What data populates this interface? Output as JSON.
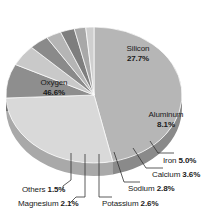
{
  "chart_data": {
    "type": "pie",
    "title": "",
    "subtitle": "",
    "xlabel": "",
    "ylabel": "",
    "legend_position": "none",
    "grid": false,
    "unit": "%",
    "categories": [
      "Oxygen",
      "Silicon",
      "Aluminum",
      "Iron",
      "Calcium",
      "Sodium",
      "Potassium",
      "Magnesium",
      "Others"
    ],
    "values": [
      46.6,
      27.7,
      8.1,
      5.0,
      3.6,
      2.8,
      2.6,
      2.1,
      1.5
    ],
    "slices": [
      {
        "name": "Oxygen",
        "value": 46.6,
        "label": "Oxygen",
        "value_label": "46.6%",
        "color": "#b6b6b6",
        "side_color": "#8a8a8a",
        "label_placement": "inside"
      },
      {
        "name": "Silicon",
        "value": 27.7,
        "label": "Silicon",
        "value_label": "27.7%",
        "color": "#d9d9d9",
        "side_color": "#a9a9a9",
        "label_placement": "inside"
      },
      {
        "name": "Aluminum",
        "value": 8.1,
        "label": "Aluminum",
        "value_label": "8.1%",
        "color": "#8e8e8e",
        "side_color": "#6d6d6d",
        "label_placement": "inside"
      },
      {
        "name": "Iron",
        "value": 5.0,
        "label": "Iron",
        "value_label": "5.0%",
        "color": "#c9c9c9",
        "side_color": "#9a9a9a",
        "label_placement": "callout"
      },
      {
        "name": "Calcium",
        "value": 3.6,
        "label": "Calcium",
        "value_label": "3.6%",
        "color": "#8a8a8a",
        "side_color": "#6a6a6a",
        "label_placement": "callout"
      },
      {
        "name": "Sodium",
        "value": 2.8,
        "label": "Sodium",
        "value_label": "2.8%",
        "color": "#b5b5b5",
        "side_color": "#8b8b8b",
        "label_placement": "callout"
      },
      {
        "name": "Potassium",
        "value": 2.6,
        "label": "Potassium",
        "value_label": "2.6%",
        "color": "#7e7e7e",
        "side_color": "#5f5f5f",
        "label_placement": "callout"
      },
      {
        "name": "Magnesium",
        "value": 2.1,
        "label": "Magnesium",
        "value_label": "2.1%",
        "color": "#a8a8a8",
        "side_color": "#808080",
        "label_placement": "callout"
      },
      {
        "name": "Others",
        "value": 1.5,
        "label": "Others",
        "value_label": "1.5%",
        "color": "#cfcfcf",
        "side_color": "#9e9e9e",
        "label_placement": "callout"
      }
    ]
  },
  "labels": {
    "oxygen": {
      "name": "Oxygen",
      "value": "46.6%"
    },
    "silicon": {
      "name": "Silicon",
      "value": "27.7%"
    },
    "aluminum": {
      "name": "Aluminum",
      "value": "8.1%"
    },
    "iron": {
      "name": "Iron ",
      "value": "5.0%"
    },
    "calcium": {
      "name": "Calcium ",
      "value": "3.6%"
    },
    "sodium": {
      "name": "Sodium ",
      "value": "2.8%"
    },
    "potassium": {
      "name": "Potassium ",
      "value": "2.6%"
    },
    "magnesium": {
      "name": "Magnesium ",
      "value": "2.1%"
    },
    "others": {
      "name": "Others ",
      "value": "1.5%"
    }
  },
  "colors": {
    "background": "#ffffff",
    "text": "#1a1a1a",
    "leader_line": "#333333",
    "slice_edge": "#ffffff"
  }
}
